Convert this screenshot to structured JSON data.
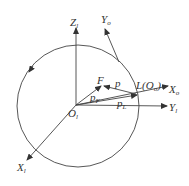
{
  "diagram": {
    "type": "coordinate-frame-diagram",
    "axes": {
      "Z_l": {
        "main": "Z",
        "sub": "l"
      },
      "Y_o": {
        "main": "Y",
        "sub": "o"
      },
      "X_o": {
        "main": "X",
        "sub": "o"
      },
      "Y_l": {
        "main": "Y",
        "sub": "l"
      },
      "X_l": {
        "main": "X",
        "sub": "l"
      }
    },
    "points": {
      "origin": {
        "main": "O",
        "sub": "l"
      },
      "F": {
        "main": "F"
      },
      "L": {
        "main": "L(O",
        "sub": "o",
        "tail": ")"
      }
    },
    "vectors": {
      "p": {
        "main": "p"
      },
      "p_F": {
        "main": "p",
        "sub": "F"
      },
      "p_L": {
        "main": "p",
        "sub": "L"
      }
    },
    "colors": {
      "stroke": "#444444",
      "text": "#333333",
      "background": "#ffffff"
    }
  }
}
